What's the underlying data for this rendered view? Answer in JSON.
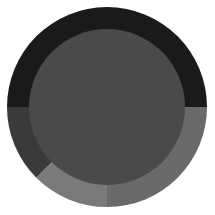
{
  "chart_data": {
    "type": "pie",
    "title": "",
    "subtitle": "",
    "xlabel": "",
    "ylabel": "",
    "variant": "donut",
    "grid": false,
    "legend": "none",
    "background_color": "#ffffff",
    "hole_color": "#4a4a4a",
    "hole_ratio": 0.78,
    "start_angle_deg": 180,
    "direction": "clockwise",
    "center": {
      "x": 107,
      "y": 107
    },
    "outer_radius": 100,
    "inner_radius": 78,
    "categories": [
      "Segment A",
      "Segment B",
      "Segment C",
      "Segment D"
    ],
    "values": [
      50,
      25,
      12.5,
      12.5
    ],
    "angles_deg": [
      180,
      90,
      45,
      45
    ],
    "colors": [
      "#1a1a1a",
      "#6a6a6a",
      "#7a7a7a",
      "#3a3a3a"
    ],
    "series": [
      {
        "name": "Segment A",
        "value": 50,
        "angle_deg": 180,
        "color": "#1a1a1a",
        "start_deg": 180,
        "end_deg": 360
      },
      {
        "name": "Segment B",
        "value": 25,
        "angle_deg": 90,
        "color": "#6a6a6a",
        "start_deg": 0,
        "end_deg": 90
      },
      {
        "name": "Segment C",
        "value": 12.5,
        "angle_deg": 45,
        "color": "#7a7a7a",
        "start_deg": 90,
        "end_deg": 135
      },
      {
        "name": "Segment D",
        "value": 12.5,
        "angle_deg": 45,
        "color": "#3a3a3a",
        "start_deg": 135,
        "end_deg": 180
      }
    ]
  }
}
